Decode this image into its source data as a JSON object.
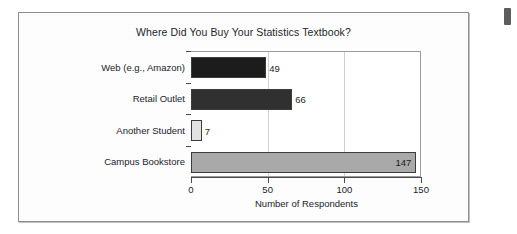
{
  "figure": {
    "background_color": "#fdfdfd",
    "border_color": "#8d8d8d"
  },
  "page_edge_marker": {
    "name": "page-edge-marker",
    "color": "#5d5d5d"
  },
  "chart_data": {
    "type": "bar",
    "orientation": "horizontal",
    "title": "Where Did You Buy Your Statistics Textbook?",
    "xlabel": "Number of Respondents",
    "ylabel": "",
    "categories": [
      "Web (e.g., Amazon)",
      "Retail Outlet",
      "Another Student",
      "Campus Bookstore"
    ],
    "values": [
      49,
      66,
      7,
      147
    ],
    "bar_colors": [
      "#1c1c1c",
      "#303030",
      "#e2e2e2",
      "#a9a9a9"
    ],
    "bar_label_positions": [
      "outside",
      "outside",
      "outside",
      "inside"
    ],
    "xlim": [
      0,
      150
    ],
    "xticks": [
      0,
      50,
      100,
      150
    ],
    "xtick_labels": [
      "0",
      "50",
      "100",
      "150"
    ],
    "gridlines": [
      50,
      100
    ],
    "grid": true,
    "grid_color": "#cfcfcf",
    "legend": null,
    "legend_position": "none",
    "axis_color": "#4a4a4a",
    "plot_background": "#ffffff"
  }
}
